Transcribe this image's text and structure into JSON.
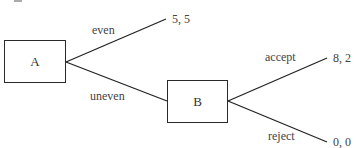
{
  "diagram": {
    "type": "game-tree",
    "nodes": [
      {
        "id": "A",
        "label": "A"
      },
      {
        "id": "B",
        "label": "B"
      }
    ],
    "edges": [
      {
        "from": "A",
        "action": "even",
        "to": "payoff_even"
      },
      {
        "from": "A",
        "action": "uneven",
        "to": "B"
      },
      {
        "from": "B",
        "action": "accept",
        "to": "payoff_accept"
      },
      {
        "from": "B",
        "action": "reject",
        "to": "payoff_reject"
      }
    ],
    "payoffs": {
      "even": "5, 5",
      "accept": "8, 2",
      "reject": "0, 0"
    },
    "colors": {
      "line": "#222222",
      "text": "#444444",
      "background": "#ffffff"
    }
  }
}
